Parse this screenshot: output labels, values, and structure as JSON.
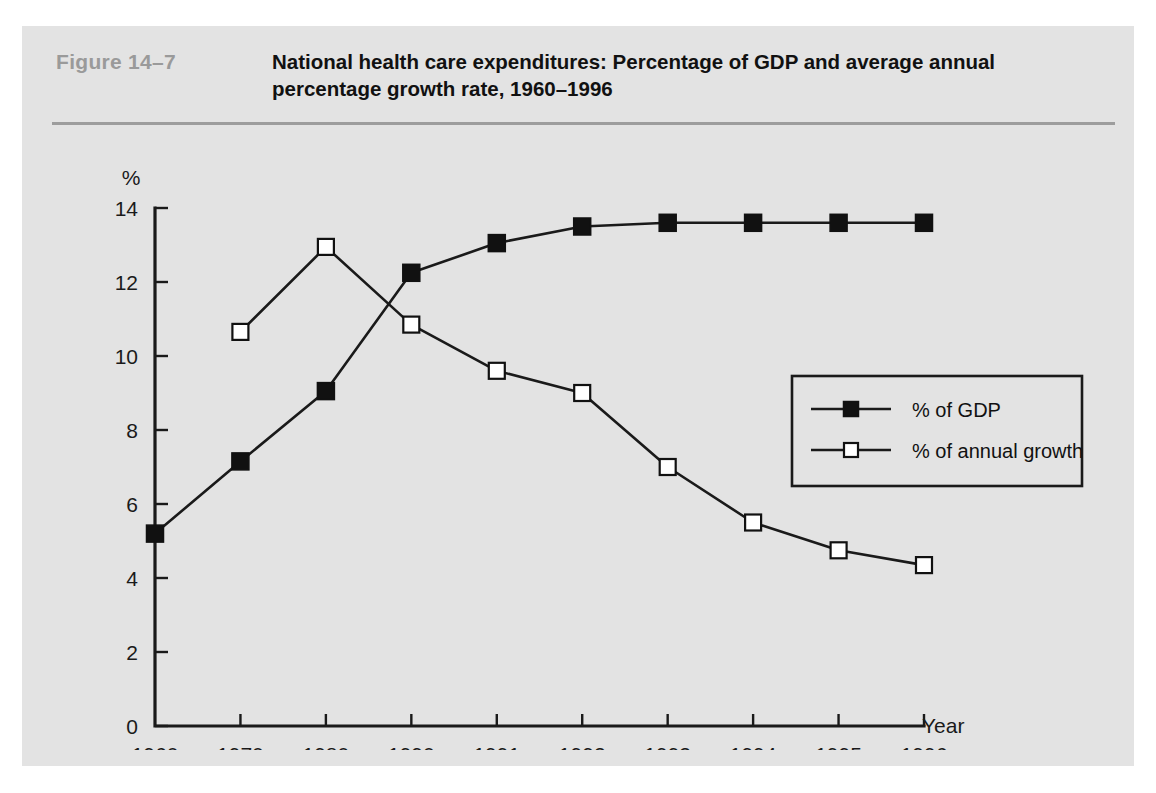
{
  "figure": {
    "label": "Figure  14–7",
    "title_line1": "National health care expenditures: Percentage of GDP and average annual",
    "title_line2": "percentage growth rate, 1960–1996",
    "panel_color": "#e3e3e3",
    "label_color": "#9a9a9a",
    "rule_color": "#9d9d9d",
    "ink_color": "#1a1a1a"
  },
  "chart_data": {
    "type": "line",
    "title": "National health care expenditures: Percentage of GDP and average annual percentage growth rate, 1960–1996",
    "xlabel": "Year",
    "ylabel": "%",
    "categories": [
      "1960",
      "1970",
      "1980",
      "1990",
      "1991",
      "1992",
      "1993",
      "1994",
      "1995",
      "1996"
    ],
    "ylim": [
      0,
      14
    ],
    "yticks": [
      0,
      2,
      4,
      6,
      8,
      10,
      12,
      14
    ],
    "ytick_labels": [
      "0",
      "2",
      "4",
      "6",
      "8",
      "10",
      "12",
      "14"
    ],
    "grid": false,
    "legend_position": "right",
    "series": [
      {
        "name": "% of GDP",
        "marker": "filled-square",
        "values": [
          5.2,
          7.15,
          9.05,
          12.25,
          13.05,
          13.5,
          13.6,
          13.6,
          13.6,
          13.6
        ]
      },
      {
        "name": "% of annual growth",
        "marker": "open-square",
        "values": [
          null,
          10.65,
          12.95,
          10.85,
          9.6,
          9.0,
          7.0,
          5.5,
          4.75,
          4.35
        ]
      }
    ]
  },
  "legend": {
    "items": [
      {
        "label": "% of GDP",
        "marker": "filled-square"
      },
      {
        "label": "% of annual growth",
        "marker": "open-square"
      }
    ]
  }
}
